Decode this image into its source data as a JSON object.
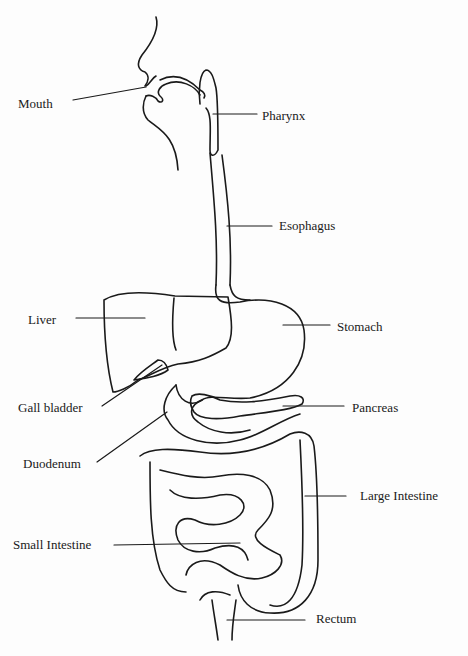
{
  "diagram": {
    "type": "anatomy",
    "labels": [
      {
        "id": "mouth",
        "text": "Mouth",
        "x": 18,
        "y": 97,
        "line": [
          73,
          100,
          146,
          87
        ]
      },
      {
        "id": "pharynx",
        "text": "Pharynx",
        "x": 262,
        "y": 109,
        "line": [
          213,
          114,
          257,
          114
        ]
      },
      {
        "id": "esophagus",
        "text": "Esophagus",
        "x": 279,
        "y": 219,
        "line": [
          227,
          226,
          272,
          226
        ]
      },
      {
        "id": "liver",
        "text": "Liver",
        "x": 28,
        "y": 313,
        "line": [
          76,
          318,
          145,
          318
        ]
      },
      {
        "id": "stomach",
        "text": "Stomach",
        "x": 337,
        "y": 320,
        "line": [
          283,
          325,
          330,
          325
        ]
      },
      {
        "id": "gall_bladder",
        "text": "Gall bladder",
        "x": 18,
        "y": 405,
        "line": [
          102,
          406,
          162,
          365
        ]
      },
      {
        "id": "pancreas",
        "text": "Pancreas",
        "x": 352,
        "y": 402,
        "line": [
          283,
          406,
          344,
          406
        ]
      },
      {
        "id": "duodenum",
        "text": "Duodenum",
        "x": 23,
        "y": 458,
        "line": [
          97,
          462,
          167,
          412
        ]
      },
      {
        "id": "large_intestine",
        "text": "Large Intestine",
        "x": 360,
        "y": 489,
        "line": [
          305,
          496,
          346,
          496
        ]
      },
      {
        "id": "small_intestine",
        "text": "Small Intestine",
        "x": 13,
        "y": 538,
        "line": [
          114,
          545,
          240,
          543
        ]
      },
      {
        "id": "rectum",
        "text": "Rectum",
        "x": 316,
        "y": 612,
        "line": [
          227,
          620,
          305,
          620
        ]
      }
    ]
  }
}
